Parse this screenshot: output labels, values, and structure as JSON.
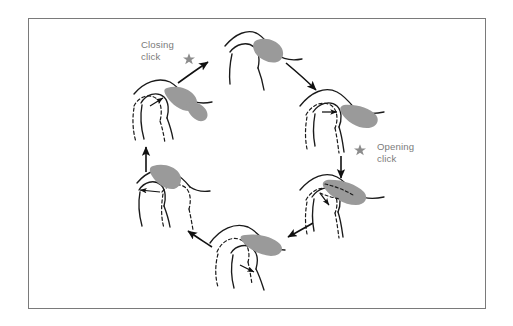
{
  "figure": {
    "domain": "anatomical-diagram",
    "frame": {
      "border_color": "#7a7a7a",
      "background_color": "#ffffff",
      "x": 28,
      "y": 18,
      "width": 458,
      "height": 291
    },
    "colors": {
      "outline": "#1a1a1a",
      "disc_fill": "#9a9a9a",
      "label_text": "#7b7b7b",
      "star": "#8c8c8c",
      "arrow": "#111111",
      "background": "#ffffff",
      "frame_border": "#7a7a7a"
    },
    "labels": [
      {
        "id": "closing-click",
        "lines": [
          "Closing",
          "click"
        ],
        "line1": "Closing",
        "line2": "click",
        "x": 141,
        "y": 48,
        "marker": "star-icon"
      },
      {
        "id": "opening-click",
        "lines": [
          "Opening",
          "click"
        ],
        "line1": "Opening",
        "line2": "click",
        "x": 377,
        "y": 150,
        "marker": "star-icon"
      }
    ],
    "stars": [
      {
        "id": "closing-click-star",
        "cx": 189,
        "cy": 59,
        "r": 5.2
      },
      {
        "id": "opening-click-star",
        "cx": 360,
        "cy": 150,
        "r": 5.2
      }
    ],
    "stages": [
      {
        "id": "stage-1-top",
        "position": "top",
        "description": "Closed position, disc anteriorly displaced relative to condyle",
        "cx": 262,
        "cy": 58,
        "has_dashed_outline": false,
        "has_internal_arrow": false
      },
      {
        "id": "stage-2-upper-right",
        "position": "upper-right",
        "description": "Early opening, condyle translating forward, disc still displaced",
        "cx": 343,
        "cy": 113,
        "has_dashed_outline": true,
        "has_internal_arrow": true,
        "internal_arrow_direction": "right"
      },
      {
        "id": "stage-3-lower-right",
        "position": "lower-right",
        "description": "Opening click, disc reduces onto condyle",
        "cx": 345,
        "cy": 200,
        "has_dashed_outline": true,
        "has_internal_arrow": true,
        "internal_arrow_direction": "down-right"
      },
      {
        "id": "stage-4-bottom",
        "position": "bottom",
        "description": "Maximum opening, disc-condyle complex translated under eminence",
        "cx": 257,
        "cy": 255,
        "has_dashed_outline": true,
        "has_internal_arrow": true,
        "internal_arrow_direction": "right"
      },
      {
        "id": "stage-5-lower-left",
        "position": "lower-left",
        "description": "Early closing, condyle translating backward with disc",
        "cx": 168,
        "cy": 200,
        "has_dashed_outline": true,
        "has_internal_arrow": true,
        "internal_arrow_direction": "left"
      },
      {
        "id": "stage-6-upper-left",
        "position": "upper-left",
        "description": "Closing click, disc displaces anteriorly again",
        "cx": 168,
        "cy": 110,
        "has_dashed_outline": true,
        "has_internal_arrow": true,
        "internal_arrow_direction": "up-right"
      }
    ],
    "cycle_arrows": [
      {
        "id": "arrow-closing-to-top",
        "from": "stage-6-upper-left",
        "to": "stage-1-top",
        "direction": "up-right"
      },
      {
        "id": "arrow-top-to-upper-right",
        "from": "stage-1-top",
        "to": "stage-2-upper-right",
        "direction": "down-right"
      },
      {
        "id": "arrow-upper-right-to-lower-right",
        "from": "stage-2-upper-right",
        "to": "stage-3-lower-right",
        "direction": "down"
      },
      {
        "id": "arrow-lower-right-to-bottom",
        "from": "stage-3-lower-right",
        "to": "stage-4-bottom",
        "direction": "down-left"
      },
      {
        "id": "arrow-bottom-to-lower-left",
        "from": "stage-4-bottom",
        "to": "stage-5-lower-left",
        "direction": "up-left"
      },
      {
        "id": "arrow-lower-left-to-upper-left",
        "from": "stage-5-lower-left",
        "to": "stage-6-upper-left",
        "direction": "up"
      }
    ],
    "cycle_direction": "clockwise",
    "stage_count": 6
  }
}
